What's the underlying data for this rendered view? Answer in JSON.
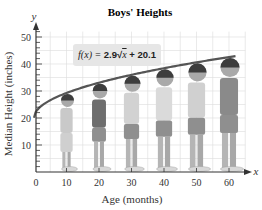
{
  "chart_data": {
    "type": "line",
    "title": "Boys' Heights",
    "xlabel": "Age (months)",
    "ylabel": "Median Height (inches)",
    "x_axis_var": "x",
    "y_axis_var": "y",
    "xlim": [
      0,
      65
    ],
    "ylim": [
      0,
      55
    ],
    "x_ticks": [
      0,
      10,
      20,
      30,
      40,
      50,
      60
    ],
    "y_ticks": [
      10,
      20,
      30,
      40,
      50
    ],
    "grid": true,
    "annotation": "f(x) = 2.9√x + 20.1",
    "formula": {
      "prefix": "f(x) = ",
      "coef": "2.9",
      "radicand": "x",
      "suffix": " + 20.1"
    },
    "series": [
      {
        "name": "f(x) = 2.9√x + 20.1",
        "x": [
          0,
          10,
          20,
          30,
          40,
          50,
          60
        ],
        "values": [
          20.1,
          29.3,
          33.1,
          36.0,
          38.4,
          40.6,
          42.6
        ]
      }
    ],
    "illustrations": [
      {
        "age": 10,
        "label": "boy figure at 10 months"
      },
      {
        "age": 20,
        "label": "boy figure at 20 months"
      },
      {
        "age": 30,
        "label": "boy figure at 30 months"
      },
      {
        "age": 40,
        "label": "boy figure at 40 months"
      },
      {
        "age": 50,
        "label": "boy figure at 50 months"
      },
      {
        "age": 60,
        "label": "boy figure at 60 months"
      }
    ]
  },
  "colors": {
    "curve": "#555555",
    "grid": "#dcdcdc",
    "axis": "#333333",
    "formula_bg": "#e6e6e6"
  }
}
